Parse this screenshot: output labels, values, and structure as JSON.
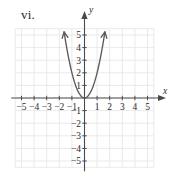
{
  "figure": {
    "label": "vi."
  },
  "chart_data": {
    "type": "line",
    "title": "",
    "subtitle": "",
    "xlabel": "x",
    "ylabel": "y",
    "xlim": [
      -5.5,
      5.5
    ],
    "ylim": [
      -5.5,
      5.5
    ],
    "grid": true,
    "legend": null,
    "legend_position": "none",
    "x_ticks": [
      -5,
      -4,
      -3,
      -2,
      -1,
      1,
      2,
      3,
      4,
      5
    ],
    "y_ticks": [
      5,
      4,
      3,
      2,
      1,
      -1,
      -2,
      -3,
      -4,
      -5
    ],
    "x_tick_labels": [
      "-5",
      "-4",
      "-3",
      "-2",
      "-1",
      "1",
      "2",
      "3",
      "4",
      "5"
    ],
    "y_tick_labels": [
      "5",
      "4",
      "3",
      "2",
      "1",
      "-1",
      "-2",
      "-3",
      "-4",
      "-5"
    ],
    "series": [
      {
        "name": "parabola",
        "equation": "y = 2x^2",
        "color": "#5a5a5a",
        "vertex": [
          0,
          0
        ],
        "arrows": [
          "start",
          "end"
        ],
        "x": [
          -1.62,
          -1.5,
          -1.4,
          -1.3,
          -1.2,
          -1.1,
          -1.0,
          -0.9,
          -0.8,
          -0.7,
          -0.6,
          -0.5,
          -0.4,
          -0.3,
          -0.2,
          -0.1,
          0,
          0.1,
          0.2,
          0.3,
          0.4,
          0.5,
          0.6,
          0.7,
          0.8,
          0.9,
          1.0,
          1.1,
          1.2,
          1.3,
          1.4,
          1.5,
          1.62
        ],
        "values": [
          5.25,
          4.5,
          3.92,
          3.38,
          2.88,
          2.42,
          2.0,
          1.62,
          1.28,
          0.98,
          0.72,
          0.5,
          0.32,
          0.18,
          0.08,
          0.02,
          0,
          0.02,
          0.08,
          0.18,
          0.32,
          0.5,
          0.72,
          0.98,
          1.28,
          1.62,
          2.0,
          2.42,
          2.88,
          3.38,
          3.92,
          4.5,
          5.25
        ]
      }
    ],
    "colors": {
      "grid": "#e6e4e6",
      "axis": "#4a4a4a",
      "curve": "#5a5a5a",
      "text": "#2b2b2b",
      "background": "#ffffff"
    }
  }
}
